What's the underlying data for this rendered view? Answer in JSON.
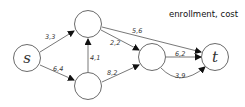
{
  "title": "enrollment, cost",
  "nodes": [
    {
      "id": "s",
      "label": "s",
      "cx": 27,
      "cy": 58
    },
    {
      "id": "a",
      "label": "",
      "cx": 88,
      "cy": 24
    },
    {
      "id": "b",
      "label": "",
      "cx": 88,
      "cy": 86
    },
    {
      "id": "c",
      "label": "",
      "cx": 152,
      "cy": 57
    },
    {
      "id": "t",
      "label": "t",
      "cx": 215,
      "cy": 57
    }
  ],
  "edges": [
    {
      "from": "s",
      "to": "a",
      "label": "3,3"
    },
    {
      "from": "s",
      "to": "b",
      "label": "6,4"
    },
    {
      "from": "b",
      "to": "a",
      "label": "4,1"
    },
    {
      "from": "a",
      "to": "c",
      "label": "2,2"
    },
    {
      "from": "a",
      "to": "t",
      "label": "5,6"
    },
    {
      "from": "b",
      "to": "c",
      "label": "8,2"
    },
    {
      "from": "c",
      "to": "t",
      "label": "6,2"
    },
    {
      "from": "c",
      "to": "t",
      "label": "3,9",
      "curved": true
    }
  ]
}
